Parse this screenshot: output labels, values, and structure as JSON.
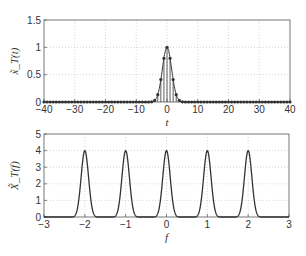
{
  "chart_data": [
    {
      "type": "stem",
      "title": "",
      "xlabel": "t",
      "ylabel": "x̃_T(t)",
      "xlim": [
        -40,
        40
      ],
      "ylim": [
        0,
        1.5
      ],
      "xticks": [
        -40,
        -30,
        -20,
        -10,
        0,
        10,
        20,
        30,
        40
      ],
      "xtick_labels": [
        "−40",
        "−30",
        "−20",
        "−10",
        "0",
        "10",
        "20",
        "30",
        "40"
      ],
      "yticks": [
        0,
        0.5,
        1,
        1.5
      ],
      "ytick_labels": [
        "0",
        "0.5",
        "1",
        "1.5"
      ],
      "grid": true,
      "series": [
        {
          "name": "samples",
          "x": [
            -4,
            -3,
            -2,
            -1,
            0,
            1,
            2,
            3,
            4
          ],
          "values": [
            0.03,
            0.13,
            0.41,
            0.8,
            1.0,
            0.8,
            0.41,
            0.13,
            0.03
          ]
        }
      ],
      "sample_range": [
        -40,
        40
      ],
      "gaussian_decay": 0.223,
      "line_color": "#333333"
    },
    {
      "type": "line",
      "title": "",
      "xlabel": "f",
      "ylabel": "X̃_T(f)",
      "xlim": [
        -3,
        3
      ],
      "ylim": [
        0,
        5
      ],
      "xticks": [
        -3,
        -2,
        -1,
        0,
        1,
        2,
        3
      ],
      "xtick_labels": [
        "−3",
        "−2",
        "−1",
        "0",
        "1",
        "2",
        "3"
      ],
      "yticks": [
        0,
        1,
        2,
        3,
        4,
        5
      ],
      "ytick_labels": [
        "0",
        "1",
        "2",
        "3",
        "4",
        "5"
      ],
      "grid": true,
      "series": [
        {
          "name": "spectrum",
          "peak_locations": [
            -2,
            -1,
            0,
            1,
            2
          ],
          "peak_value": 4,
          "support_halfwidth": 0.3
        }
      ],
      "line_color": "#333333"
    }
  ]
}
